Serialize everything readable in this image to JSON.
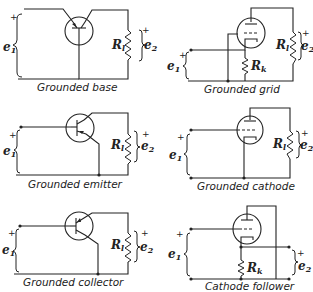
{
  "panels": [
    {
      "id": "grounded-base",
      "caption": "Grounded base",
      "device": "transistor",
      "input": "e",
      "input_sub": "1",
      "output": "e",
      "output_sub": "2",
      "load": "R",
      "load_sub": "l",
      "plus": "+"
    },
    {
      "id": "grounded-grid",
      "caption": "Grounded grid",
      "device": "triode",
      "input": "e",
      "input_sub": "1",
      "output": "e",
      "output_sub": "2",
      "load": "R",
      "load_sub": "l",
      "cathode_res": "R",
      "cathode_res_sub": "k",
      "plus": "+"
    },
    {
      "id": "grounded-emitter",
      "caption": "Grounded emitter",
      "device": "transistor",
      "input": "e",
      "input_sub": "1",
      "output": "e",
      "output_sub": "2",
      "load": "R",
      "load_sub": "l",
      "plus": "+"
    },
    {
      "id": "grounded-cathode",
      "caption": "Grounded cathode",
      "device": "triode",
      "input": "e",
      "input_sub": "1",
      "output": "e",
      "output_sub": "2",
      "load": "R",
      "load_sub": "l",
      "plus": "+"
    },
    {
      "id": "grounded-collector",
      "caption": "Grounded collector",
      "device": "transistor",
      "input": "e",
      "input_sub": "1",
      "output": "e",
      "output_sub": "2",
      "load": "R",
      "load_sub": "l",
      "plus": "+"
    },
    {
      "id": "cathode-follower",
      "caption": "Cathode follower",
      "device": "triode",
      "input": "e",
      "input_sub": "1",
      "output": "e",
      "output_sub": "2",
      "cathode_res": "R",
      "cathode_res_sub": "k",
      "plus": "+"
    }
  ]
}
